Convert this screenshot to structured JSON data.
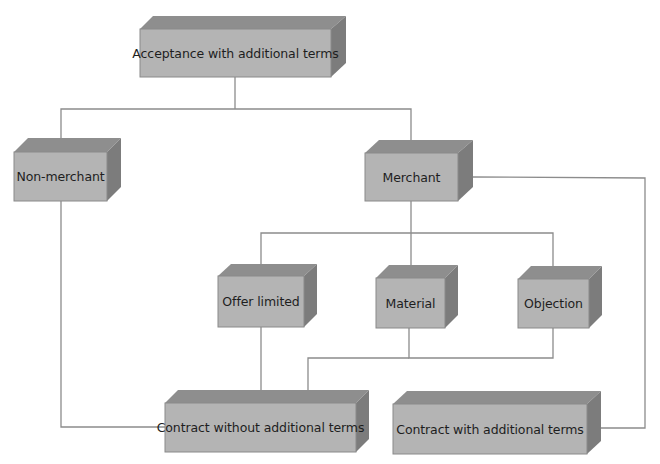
{
  "colors": {
    "front": "#b4b4b4",
    "top": "#8e8e8e",
    "side": "#7c7c7c",
    "edge": "#8a8a8a",
    "line": "#8c8c8c",
    "text": "#1e1e1e"
  },
  "nodes": {
    "acceptance": {
      "label": "Acceptance with additional terms"
    },
    "non_merchant": {
      "label": "Non-merchant"
    },
    "merchant": {
      "label": "Merchant"
    },
    "offer_limited": {
      "label": "Offer limited"
    },
    "material": {
      "label": "Material"
    },
    "objection": {
      "label": "Objection"
    },
    "contract_without": {
      "label": "Contract without additional terms"
    },
    "contract_with": {
      "label": "Contract with additional terms"
    }
  }
}
